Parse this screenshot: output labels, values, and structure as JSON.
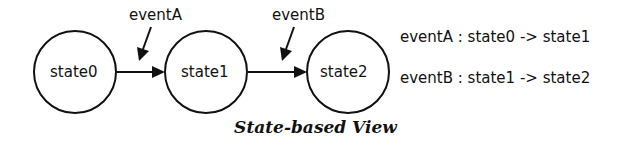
{
  "diagram": {
    "states": [
      {
        "label": "state0"
      },
      {
        "label": "state1"
      },
      {
        "label": "state2"
      }
    ],
    "events": [
      {
        "label": "eventA"
      },
      {
        "label": "eventB"
      }
    ],
    "transitions": [
      {
        "text": "eventA : state0 -> state1"
      },
      {
        "text": "eventB : state1 -> state2"
      }
    ],
    "caption": "State-based View"
  }
}
